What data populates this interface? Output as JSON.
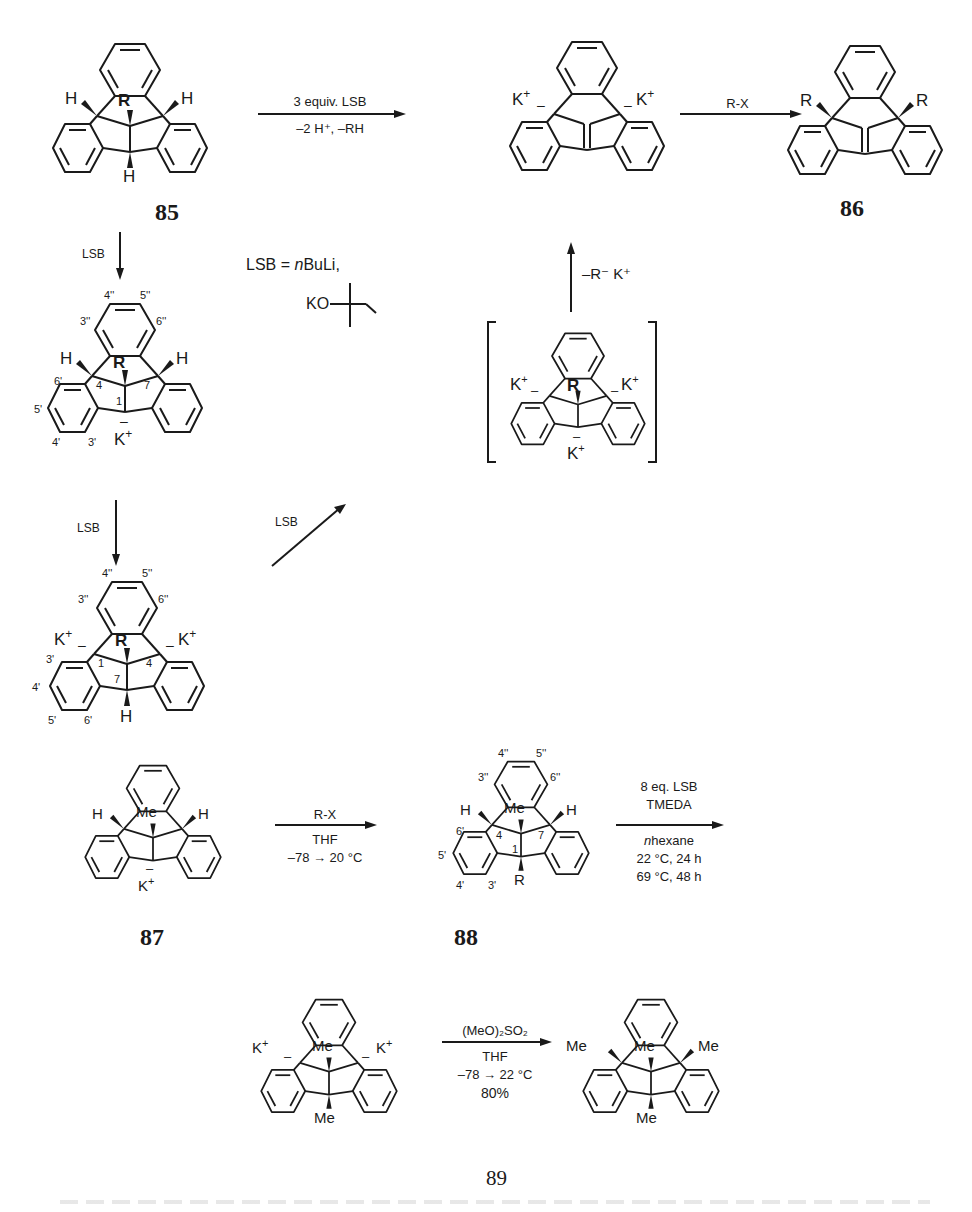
{
  "scheme": {
    "compounds": {
      "c85": {
        "label": "85",
        "center_sub": "R",
        "left_H": "H",
        "right_H": "H",
        "bottom_H": "H"
      },
      "dianion_top": {
        "left_cation": "K",
        "right_cation": "K",
        "plus": "+",
        "minus": "–"
      },
      "c86": {
        "label": "86",
        "left_sub": "R",
        "right_sub": "R"
      },
      "mono_anion": {
        "center_sub": "R",
        "left_H": "H",
        "right_H": "H",
        "cation": "K",
        "plus": "+",
        "minus": "–",
        "positions": {
          "p4pp": "4''",
          "p5pp": "5''",
          "p3pp": "3''",
          "p6pp": "6''",
          "p6p": "6'",
          "p5p": "5'",
          "p4p": "4'",
          "p3p": "3'",
          "c4": "4",
          "c7": "7",
          "c1": "1"
        }
      },
      "dianion_mid": {
        "center_sub": "R",
        "bottom_H": "H",
        "left_cation": "K",
        "right_cation": "K",
        "plus": "+",
        "minus": "–",
        "positions": {
          "p4pp": "4''",
          "p5pp": "5''",
          "p3pp": "3''",
          "p6pp": "6''",
          "p3p": "3'",
          "p4p": "4'",
          "p5p": "5'",
          "p6p": "6'",
          "c1": "1",
          "c4": "4",
          "c7": "7"
        }
      },
      "trianion": {
        "center_sub": "R",
        "left_cation": "K",
        "right_cation": "K",
        "bottom_cation": "K",
        "plus": "+",
        "minus": "–"
      },
      "c87": {
        "label": "87",
        "center_sub": "Me",
        "left_H": "H",
        "right_H": "H",
        "cation": "K",
        "plus": "+",
        "minus": "–"
      },
      "c88": {
        "label": "88",
        "center_sub": "Me",
        "left_H": "H",
        "right_H": "H",
        "bottom_sub": "R",
        "positions": {
          "p4pp": "4''",
          "p5pp": "5''",
          "p3pp": "3''",
          "p6pp": "6''",
          "p6p": "6'",
          "p5p": "5'",
          "p4p": "4'",
          "p3p": "3'",
          "c4": "4",
          "c7": "7",
          "c1": "1"
        }
      },
      "dianion_me": {
        "center_sub": "Me",
        "bottom_sub": "Me",
        "left_cation": "K",
        "right_cation": "K",
        "plus": "+",
        "minus": "–"
      },
      "c89": {
        "label": "89",
        "center_sub": "Me",
        "left_sub": "Me",
        "right_sub": "Me",
        "bottom_sub": "Me"
      }
    },
    "arrows": {
      "a1": {
        "above": "3 equiv. LSB",
        "below": "–2 H⁺, –RH"
      },
      "a2": {
        "above": "R-X"
      },
      "a3": {
        "label": "LSB"
      },
      "a4": {
        "label": "LSB"
      },
      "a5": {
        "label": "LSB"
      },
      "a6": {
        "label": "–R⁻ K⁺"
      },
      "a7": {
        "above": "R-X",
        "below1": "THF",
        "below2": "–78 → 20 °C"
      },
      "a8": {
        "above1": "8 eq. LSB",
        "above2": "TMEDA",
        "below1_italic": "n",
        "below1": "hexane",
        "below2": "22 °C, 24 h",
        "below3": "69 °C, 48 h"
      },
      "a9": {
        "above": "(MeO)₂SO₂",
        "below1": "THF",
        "below2": "–78 → 22 °C",
        "below3": "80%"
      }
    },
    "legend": {
      "lsb_def": "LSB = ",
      "lsb_italic": "n",
      "lsb_rest": "BuLi,",
      "alkoxide": "KO"
    }
  }
}
